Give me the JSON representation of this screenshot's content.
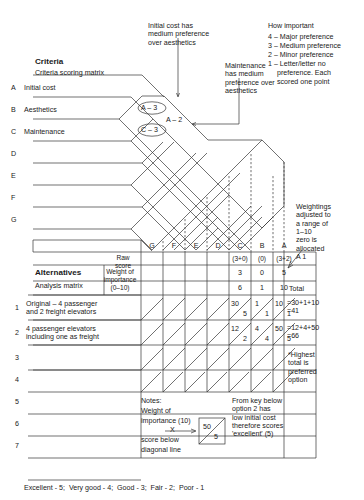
{
  "annotations": {
    "initial_cost_note": "Initial cost has\nmedium preference\nover aesthetics",
    "maintenance_note": "Maintenance\nhas medium\npreference over\naesthetics",
    "weightings_note": "Weightings\nadjusted to\na range of\n1–10\nzero is\nallocated\nA 1",
    "highest_note": "*Highest\ntotal is\npreferred\noption",
    "key_note": "From key below\noption 2 has\nlow initial cost\ntherefore scores\n'excellent' (5)"
  },
  "legend": {
    "title": "How important",
    "items": [
      "4 – Major preference",
      "3 – Medium preference",
      "2 – Minor preference",
      "1 – Letter/letter no",
      "preference. Each",
      "scored one point"
    ]
  },
  "criteria": {
    "title": "Criteria",
    "subtitle": "Criteria scoring matrix",
    "rows": [
      {
        "letter": "A",
        "label": "Initial cost"
      },
      {
        "letter": "B",
        "label": "Aesthetics"
      },
      {
        "letter": "C",
        "label": "Maintenance"
      },
      {
        "letter": "D",
        "label": ""
      },
      {
        "letter": "E",
        "label": ""
      },
      {
        "letter": "F",
        "label": ""
      },
      {
        "letter": "G",
        "label": ""
      }
    ],
    "cell_labels": [
      {
        "text": "A – 3",
        "circled": true
      },
      {
        "text": "A – 2",
        "circled": false
      },
      {
        "text": "C – 3",
        "circled": true
      }
    ]
  },
  "matrix": {
    "columns": [
      "G",
      "F",
      "E",
      "D",
      "C",
      "B",
      "A"
    ],
    "raw_score_label": "Raw\nscore",
    "weight_label": "Weight of\nimportance\n(0–10)",
    "raw_expr": [
      "",
      "",
      "",
      "",
      "(3+0)",
      "(0)",
      "(3+2)"
    ],
    "raw_values": [
      "",
      "",
      "",
      "",
      "3",
      "0",
      "5"
    ],
    "weights": [
      "",
      "",
      "",
      "",
      "6",
      "1",
      "10"
    ],
    "total_header": "Total"
  },
  "alternatives": {
    "title": "Alternatives",
    "subtitle": "Analysis matrix",
    "rows": [
      {
        "num": "1",
        "label": "Original – 4 passenger\nand 2 freight elevators",
        "cells": [
          {
            "upper": "",
            "lower": ""
          },
          {
            "upper": "",
            "lower": ""
          },
          {
            "upper": "",
            "lower": ""
          },
          {
            "upper": "",
            "lower": ""
          },
          {
            "upper": "30",
            "lower": "5"
          },
          {
            "upper": "1",
            "lower": "1"
          },
          {
            "upper": "10",
            "lower": "1"
          }
        ],
        "total": "=30+1+10\n=41"
      },
      {
        "num": "2",
        "label": "4 passenger elevators\nincluding one as freight",
        "cells": [
          {
            "upper": "",
            "lower": ""
          },
          {
            "upper": "",
            "lower": ""
          },
          {
            "upper": "",
            "lower": ""
          },
          {
            "upper": "",
            "lower": ""
          },
          {
            "upper": "12",
            "lower": "2"
          },
          {
            "upper": "4",
            "lower": "4"
          },
          {
            "upper": "50",
            "lower": "5"
          }
        ],
        "total": "=12+4+50\n=66"
      },
      {
        "num": "3",
        "label": "",
        "cells": [],
        "total": ""
      },
      {
        "num": "4",
        "label": "",
        "cells": [],
        "total": ""
      },
      {
        "num": "5",
        "label": "",
        "cells": [],
        "total": ""
      },
      {
        "num": "6",
        "label": "",
        "cells": [],
        "total": ""
      },
      {
        "num": "7",
        "label": "",
        "cells": [],
        "total": ""
      }
    ]
  },
  "notes": {
    "heading": "Notes:",
    "line1": "Weight of",
    "line2": "importance (10)",
    "multiply": "X",
    "line3": "score below",
    "line4": "diagonal line",
    "example_upper": "50",
    "example_lower": "5"
  },
  "key": "Excellent - 5;  Very good - 4;  Good - 3;  Fair - 2;  Poor - 1"
}
